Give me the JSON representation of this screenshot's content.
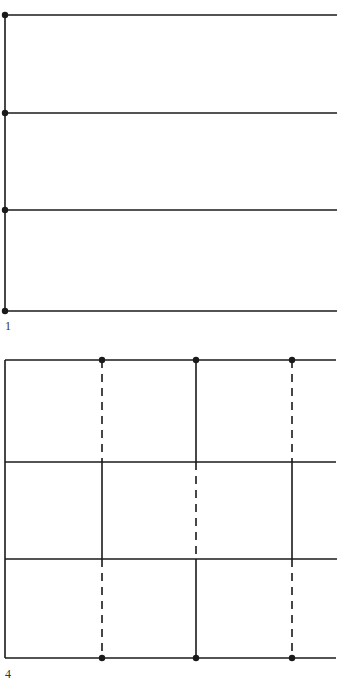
{
  "figures": [
    {
      "label": "1",
      "label_pos": {
        "x": 5,
        "y": 320
      },
      "description": "Single vertical axis with four horizontal lines, each with a dot at its left end",
      "stroke_color": "#1a1a1a",
      "vertical_lines": [
        {
          "x": 5,
          "y1": 15,
          "y2": 312,
          "style": "solid"
        }
      ],
      "horizontal_lines": [
        {
          "y": 15,
          "x1": 5,
          "x2": 337,
          "style": "solid"
        },
        {
          "y": 113,
          "x1": 5,
          "x2": 337,
          "style": "solid"
        },
        {
          "y": 210,
          "x1": 5,
          "x2": 337,
          "style": "solid"
        },
        {
          "y": 311,
          "x1": 5,
          "x2": 337,
          "style": "solid"
        }
      ],
      "dots": [
        {
          "x": 5,
          "y": 15
        },
        {
          "x": 5,
          "y": 113
        },
        {
          "x": 5,
          "y": 210
        },
        {
          "x": 5,
          "y": 311
        }
      ]
    },
    {
      "label": "4",
      "label_pos": {
        "x": 5,
        "y": 668
      },
      "description": "Grid of four horizontal lines with alternating solid and dashed vertical segments in three rows; dots on top and bottom lines",
      "stroke_color": "#1a1a1a",
      "vertical_lines": [
        {
          "x": 5,
          "y1": 360,
          "y2": 658,
          "style": "solid"
        },
        {
          "x": 102,
          "y1": 360,
          "y2": 462,
          "style": "dashed"
        },
        {
          "x": 196,
          "y1": 360,
          "y2": 462,
          "style": "solid"
        },
        {
          "x": 292,
          "y1": 360,
          "y2": 462,
          "style": "dashed"
        },
        {
          "x": 102,
          "y1": 462,
          "y2": 559,
          "style": "solid"
        },
        {
          "x": 196,
          "y1": 462,
          "y2": 559,
          "style": "dashed"
        },
        {
          "x": 292,
          "y1": 462,
          "y2": 559,
          "style": "solid"
        },
        {
          "x": 102,
          "y1": 559,
          "y2": 658,
          "style": "dashed"
        },
        {
          "x": 196,
          "y1": 559,
          "y2": 658,
          "style": "solid"
        },
        {
          "x": 292,
          "y1": 559,
          "y2": 658,
          "style": "dashed"
        }
      ],
      "horizontal_lines": [
        {
          "y": 360,
          "x1": 5,
          "x2": 336,
          "style": "solid"
        },
        {
          "y": 462,
          "x1": 5,
          "x2": 336,
          "style": "solid"
        },
        {
          "y": 559,
          "x1": 5,
          "x2": 337,
          "style": "solid"
        },
        {
          "y": 658,
          "x1": 5,
          "x2": 336,
          "style": "solid"
        }
      ],
      "dots": [
        {
          "x": 102,
          "y": 360
        },
        {
          "x": 196,
          "y": 360
        },
        {
          "x": 292,
          "y": 360
        },
        {
          "x": 102,
          "y": 658
        },
        {
          "x": 196,
          "y": 658
        },
        {
          "x": 292,
          "y": 658
        }
      ]
    }
  ]
}
